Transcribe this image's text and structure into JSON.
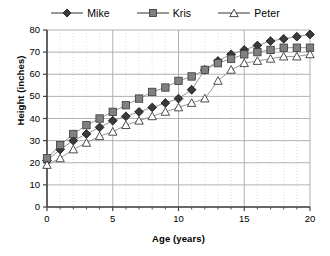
{
  "legend": {
    "position": "top-center",
    "items": [
      {
        "label": "Mike",
        "marker": "filled-diamond",
        "color": "#3a3a3a"
      },
      {
        "label": "Kris",
        "marker": "filled-square",
        "color": "#808080"
      },
      {
        "label": "Peter",
        "marker": "open-triangle",
        "color": "#ffffff"
      }
    ]
  },
  "axes": {
    "ylabel": "Height (inches)",
    "xlabel": "Age (years)",
    "yticks": [
      "0",
      "10",
      "20",
      "30",
      "40",
      "50",
      "60",
      "70",
      "80"
    ],
    "xticks": [
      "0",
      "5",
      "10",
      "15",
      "20"
    ]
  },
  "chart_data": {
    "type": "line",
    "title": "",
    "xlabel": "Age (years)",
    "ylabel": "Height (inches)",
    "xlim": [
      0,
      20
    ],
    "ylim": [
      0,
      80
    ],
    "xtick_step": 5,
    "ytick_step": 10,
    "xminor_step": 1,
    "grid": true,
    "legend_position": "top-center",
    "x": [
      0,
      1,
      2,
      3,
      4,
      5,
      6,
      7,
      8,
      9,
      10,
      11,
      12,
      13,
      14,
      15,
      16,
      17,
      18,
      19,
      20
    ],
    "series": [
      {
        "name": "Mike",
        "marker": "filled-diamond",
        "color": "#3a3a3a",
        "values": [
          21,
          26,
          30,
          33,
          36,
          39,
          41,
          43,
          45,
          47,
          49,
          53,
          62,
          66,
          69,
          71,
          73,
          75,
          76,
          77,
          78
        ]
      },
      {
        "name": "Kris",
        "marker": "filled-square",
        "color": "#808080",
        "values": [
          22,
          28,
          33,
          37,
          40,
          43,
          46,
          49,
          52,
          54,
          57,
          59,
          62,
          65,
          67,
          69,
          70,
          71,
          72,
          72,
          72
        ]
      },
      {
        "name": "Peter",
        "marker": "open-triangle",
        "color": "#ffffff",
        "values": [
          19,
          22,
          26,
          29,
          32,
          34,
          37,
          39,
          41,
          43,
          45,
          47,
          49,
          57,
          62,
          65,
          66,
          67,
          68,
          68,
          69
        ]
      }
    ]
  }
}
